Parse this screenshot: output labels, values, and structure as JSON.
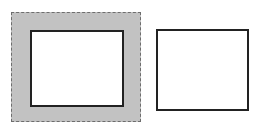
{
  "figure": {
    "background_color": "#ffffff",
    "width": 261,
    "height": 128,
    "shapes": [
      {
        "id": "outer-dashed-square",
        "role": "outer-region-with-dashed-boundary",
        "label": "",
        "fill_color": "#c2c2c2",
        "stroke_color": "#6d6d6d",
        "stroke_style": "dashed",
        "stroke_width": 1.5,
        "x": 11,
        "y": 12,
        "width": 130,
        "height": 110
      },
      {
        "id": "inner-white-square",
        "role": "inner-hole-square",
        "label": "",
        "fill_color": "#ffffff",
        "stroke_color": "#222222",
        "stroke_style": "solid",
        "stroke_width": 2.5,
        "x": 30,
        "y": 30,
        "width": 94,
        "height": 77
      },
      {
        "id": "right-white-square",
        "role": "standalone-square",
        "label": "",
        "fill_color": "#ffffff",
        "stroke_color": "#222222",
        "stroke_style": "solid",
        "stroke_width": 2.5,
        "x": 156,
        "y": 29,
        "width": 93,
        "height": 82
      }
    ]
  }
}
